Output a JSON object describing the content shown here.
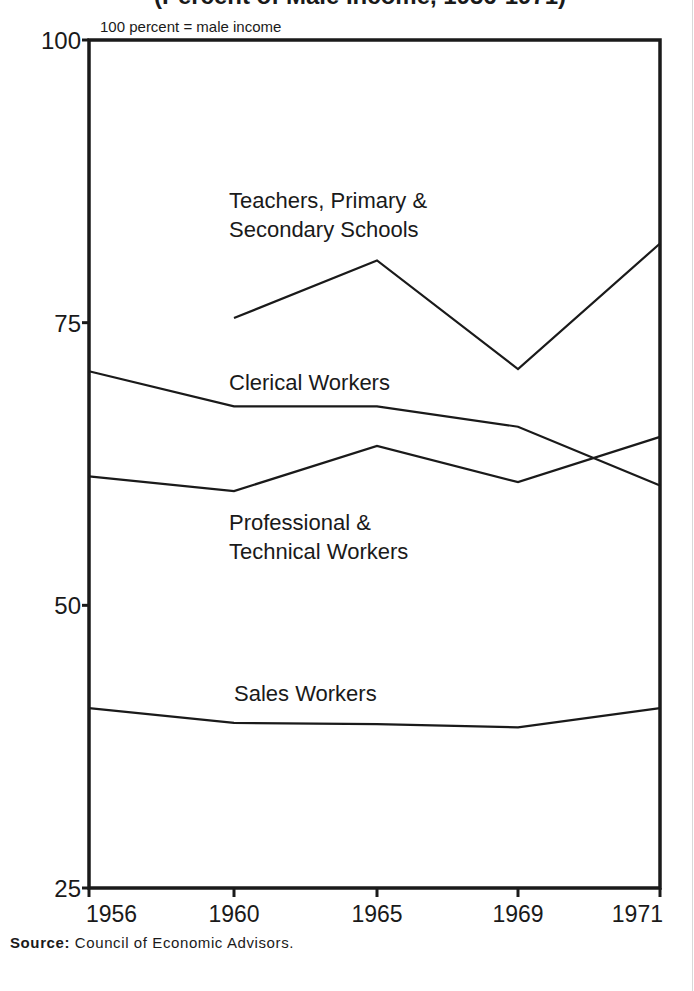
{
  "title_partial": "(Percent of Male Income, 1956-1971)",
  "unit_note": "100 percent = male income",
  "source": {
    "label": "Source:",
    "text": "Council of Economic Advisors."
  },
  "colors": {
    "line": "#1a1a1a",
    "background": "#ffffff"
  },
  "chart_data": {
    "type": "line",
    "subtitle": "100 percent = male income",
    "xlabel": "",
    "ylabel": "",
    "categories": [
      "1956",
      "1960",
      "1965",
      "1969",
      "1971"
    ],
    "ylim": [
      25,
      100
    ],
    "yticks": [
      25,
      50,
      75,
      100
    ],
    "grid": false,
    "legend": "inline labels",
    "series": [
      {
        "name": "Teachers, Primary & Secondary Schools",
        "label_lines": [
          "Teachers, Primary &",
          "Secondary Schools"
        ],
        "values": [
          null,
          75.4,
          80.5,
          70.9,
          82.0
        ]
      },
      {
        "name": "Clerical Workers",
        "label_lines": [
          "Clerical Workers"
        ],
        "values": [
          70.7,
          67.6,
          67.6,
          65.8,
          60.6
        ]
      },
      {
        "name": "Professional & Technical Workers",
        "label_lines": [
          "Professional &",
          "Technical Workers"
        ],
        "values": [
          61.4,
          60.1,
          64.1,
          60.9,
          64.9
        ]
      },
      {
        "name": "Sales Workers",
        "label_lines": [
          "Sales Workers"
        ],
        "values": [
          40.9,
          39.6,
          39.5,
          39.2,
          40.9
        ]
      }
    ],
    "source": "Council of Economic Advisors."
  }
}
